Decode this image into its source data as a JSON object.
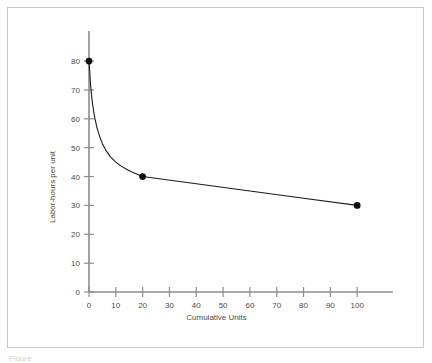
{
  "figure": {
    "caption_fragment": "Figure",
    "border_color": "#c9c9c9",
    "background": "#ffffff"
  },
  "chart_data": {
    "type": "line",
    "title": "",
    "xlabel": "Cumulative Units",
    "ylabel": "Labor-hours per unit",
    "xlim": [
      0,
      110
    ],
    "ylim": [
      0,
      88
    ],
    "xticks": [
      0,
      10,
      20,
      30,
      40,
      50,
      60,
      70,
      80,
      90,
      100
    ],
    "xtick_labels": [
      "0",
      "10",
      "20",
      "30",
      "40",
      "50",
      "60",
      "70",
      "80",
      "90",
      "100"
    ],
    "yticks": [
      0,
      10,
      20,
      30,
      40,
      50,
      60,
      70,
      80
    ],
    "ytick_labels": [
      "0",
      "10",
      "20",
      "30",
      "40",
      "50",
      "60",
      "70",
      "80"
    ],
    "grid": false,
    "legend": null,
    "line_color": "#1a1a1a",
    "marker_color": "#111111",
    "marker_style": "circle",
    "x": [
      0,
      20,
      100
    ],
    "values": [
      80,
      40,
      30
    ],
    "series": [
      {
        "name": "Learning curve",
        "x": [
          0,
          20,
          100
        ],
        "values": [
          80,
          40,
          30
        ]
      }
    ],
    "curve_points": [
      [
        0,
        80
      ],
      [
        0.6,
        71.5
      ],
      [
        1.2,
        66.0
      ],
      [
        2.0,
        61.0
      ],
      [
        3.0,
        56.8
      ],
      [
        4.0,
        53.8
      ],
      [
        5.0,
        51.4
      ],
      [
        6.5,
        48.8
      ],
      [
        8.0,
        46.8
      ],
      [
        10.0,
        45.0
      ],
      [
        12.0,
        43.6
      ],
      [
        14.0,
        42.5
      ],
      [
        16.0,
        41.6
      ],
      [
        18.0,
        40.8
      ],
      [
        20.0,
        40.0
      ],
      [
        40.0,
        37.5
      ],
      [
        60.0,
        35.0
      ],
      [
        80.0,
        32.5
      ],
      [
        100.0,
        30.0
      ]
    ],
    "annotations": []
  },
  "axes": {
    "x_axis_name": "x-axis",
    "y_axis_name": "y-axis",
    "axis_color": "#8c8c8c",
    "tick_color": "#8c8c8c"
  }
}
